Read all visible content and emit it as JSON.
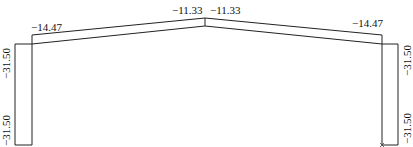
{
  "diagram": {
    "type": "portal-frame-force-diagram",
    "colors": {
      "line": "#222222",
      "text": "#111111",
      "background": "#ffffff"
    },
    "labels": {
      "left_eave": "−14.47",
      "apex_left": "−11.33",
      "apex_right": "−11.33",
      "right_eave": "−14.47",
      "left_column_top": "−31.50",
      "left_column_bottom": "−31.50",
      "right_column_top": "−31.50",
      "right_column_bottom": "−31.50"
    },
    "values": {
      "rafter_eave": -14.47,
      "rafter_apex": -11.33,
      "column": -31.5
    }
  }
}
